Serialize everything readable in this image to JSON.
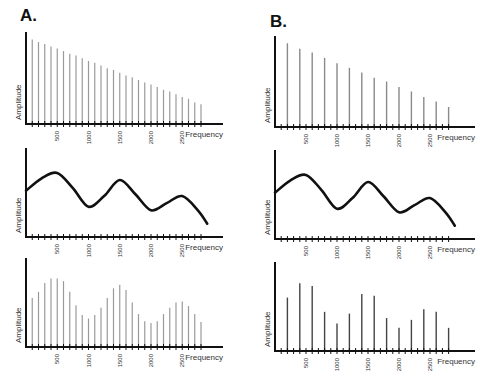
{
  "panels": {
    "a": {
      "label": "A."
    },
    "b": {
      "label": "B."
    }
  },
  "axis": {
    "xlabel": "Frequency",
    "ylabel": "Amplitude",
    "tick_labels": [
      "500",
      "1000",
      "1500",
      "2000",
      "2500"
    ]
  },
  "chart_data": [
    {
      "id": "A-top",
      "type": "bar",
      "title": "",
      "panel": "A",
      "description": "Harmonic spectrum of glottal source: harmonics every 100 Hz with linearly decreasing amplitude",
      "xlabel": "Frequency",
      "ylabel": "Amplitude",
      "xlim": [
        0,
        2900
      ],
      "x": [
        100,
        200,
        300,
        400,
        500,
        600,
        700,
        800,
        900,
        1000,
        1100,
        1200,
        1300,
        1400,
        1500,
        1600,
        1700,
        1800,
        1900,
        2000,
        2100,
        2200,
        2300,
        2400,
        2500,
        2600,
        2700,
        2800
      ],
      "values": [
        0.94,
        0.91,
        0.89,
        0.86,
        0.84,
        0.81,
        0.78,
        0.76,
        0.73,
        0.7,
        0.68,
        0.65,
        0.62,
        0.6,
        0.57,
        0.54,
        0.52,
        0.49,
        0.46,
        0.44,
        0.41,
        0.38,
        0.36,
        0.33,
        0.3,
        0.28,
        0.24,
        0.22
      ],
      "xticks": [
        500,
        1000,
        1500,
        2000,
        2500
      ],
      "grid": false
    },
    {
      "id": "A-middle",
      "type": "line",
      "panel": "A",
      "description": "Vocal tract filter function with resonance peaks near 500, 1500, 2500 Hz",
      "xlabel": "Frequency",
      "ylabel": "Amplitude",
      "x": [
        0,
        250,
        500,
        750,
        1000,
        1250,
        1500,
        1750,
        2000,
        2250,
        2500,
        2750,
        2900
      ],
      "values": [
        0.52,
        0.66,
        0.72,
        0.55,
        0.34,
        0.46,
        0.64,
        0.48,
        0.3,
        0.38,
        0.46,
        0.3,
        0.15
      ],
      "peaks_hz": [
        500,
        1500,
        2500
      ],
      "xticks": [
        500,
        1000,
        1500,
        2000,
        2500
      ],
      "grid": false
    },
    {
      "id": "A-bottom",
      "type": "bar",
      "panel": "A",
      "description": "Output spectrum: source harmonics (100 Hz spacing) shaped by filter",
      "xlabel": "Frequency",
      "ylabel": "Amplitude",
      "x": [
        100,
        200,
        300,
        400,
        500,
        600,
        700,
        800,
        900,
        1000,
        1100,
        1200,
        1300,
        1400,
        1500,
        1600,
        1700,
        1800,
        1900,
        2000,
        2100,
        2200,
        2300,
        2400,
        2500,
        2600,
        2700,
        2800
      ],
      "values": [
        0.55,
        0.62,
        0.72,
        0.77,
        0.77,
        0.74,
        0.62,
        0.47,
        0.36,
        0.32,
        0.36,
        0.44,
        0.55,
        0.66,
        0.7,
        0.64,
        0.5,
        0.37,
        0.29,
        0.27,
        0.29,
        0.37,
        0.44,
        0.5,
        0.51,
        0.46,
        0.37,
        0.28,
        0.22,
        0.18
      ],
      "xticks": [
        500,
        1000,
        1500,
        2000,
        2500
      ],
      "grid": false
    },
    {
      "id": "B-top",
      "type": "bar",
      "panel": "B",
      "description": "Harmonic spectrum with 200 Hz fundamental and linearly decreasing amplitude",
      "xlabel": "Frequency",
      "ylabel": "Amplitude",
      "x": [
        200,
        400,
        600,
        800,
        1000,
        1200,
        1400,
        1600,
        1800,
        2000,
        2200,
        2400,
        2600,
        2800
      ],
      "values": [
        0.92,
        0.86,
        0.82,
        0.76,
        0.7,
        0.65,
        0.6,
        0.54,
        0.5,
        0.44,
        0.39,
        0.33,
        0.28,
        0.22,
        0.17
      ],
      "xticks": [
        500,
        1000,
        1500,
        2000,
        2500
      ],
      "grid": false
    },
    {
      "id": "B-middle",
      "type": "line",
      "panel": "B",
      "description": "Same vocal tract filter function as A",
      "xlabel": "Frequency",
      "ylabel": "Amplitude",
      "x": [
        0,
        250,
        500,
        750,
        1000,
        1250,
        1500,
        1750,
        2000,
        2250,
        2500,
        2750,
        2900
      ],
      "values": [
        0.52,
        0.66,
        0.72,
        0.55,
        0.34,
        0.46,
        0.64,
        0.48,
        0.3,
        0.38,
        0.46,
        0.3,
        0.15
      ],
      "peaks_hz": [
        500,
        1500,
        2500
      ],
      "xticks": [
        500,
        1000,
        1500,
        2000,
        2500
      ],
      "grid": false
    },
    {
      "id": "B-bottom",
      "type": "bar",
      "panel": "B",
      "description": "Output spectrum: 200 Hz harmonics shaped by filter",
      "xlabel": "Frequency",
      "ylabel": "Amplitude",
      "x": [
        200,
        400,
        600,
        800,
        1000,
        1200,
        1400,
        1600,
        1800,
        2000,
        2200,
        2400,
        2600,
        2800
      ],
      "values": [
        0.6,
        0.76,
        0.73,
        0.44,
        0.31,
        0.42,
        0.64,
        0.62,
        0.37,
        0.26,
        0.35,
        0.47,
        0.44,
        0.26,
        0.16
      ],
      "xticks": [
        500,
        1000,
        1500,
        2000,
        2500
      ],
      "grid": false
    }
  ]
}
